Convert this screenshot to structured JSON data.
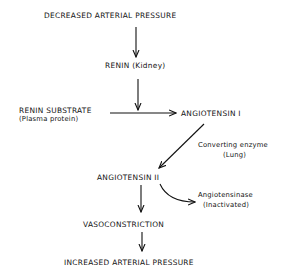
{
  "diagram": {
    "nodes": {
      "decreased_pressure": "DECREASED ARTERIAL PRESSURE",
      "renin": "RENIN (Kidney)",
      "renin_substrate": "RENIN SUBSTRATE",
      "renin_substrate_note": "(Plasma protein)",
      "angiotensin_1": "ANGIOTENSIN I",
      "converting_enzyme": "Converting enzyme",
      "converting_enzyme_note": "(Lung)",
      "angiotensin_2": "ANGIOTENSIN II",
      "angiotensinase": "Angiotensinase",
      "angiotensinase_note": "(Inactivated)",
      "vasoconstriction": "VASOCONSTRICTION",
      "increased_pressure": "INCREASED ARTERIAL PRESSURE"
    },
    "edges": [
      {
        "from": "decreased_pressure",
        "to": "renin"
      },
      {
        "from": "renin",
        "to": "substrate_to_angiotensin_1"
      },
      {
        "from": "renin_substrate",
        "to": "angiotensin_1"
      },
      {
        "from": "angiotensin_1",
        "to": "angiotensin_2",
        "label": "converting_enzyme"
      },
      {
        "from": "angiotensin_2",
        "to": "angiotensinase"
      },
      {
        "from": "angiotensin_2",
        "to": "vasoconstriction"
      },
      {
        "from": "vasoconstriction",
        "to": "increased_pressure"
      }
    ]
  }
}
